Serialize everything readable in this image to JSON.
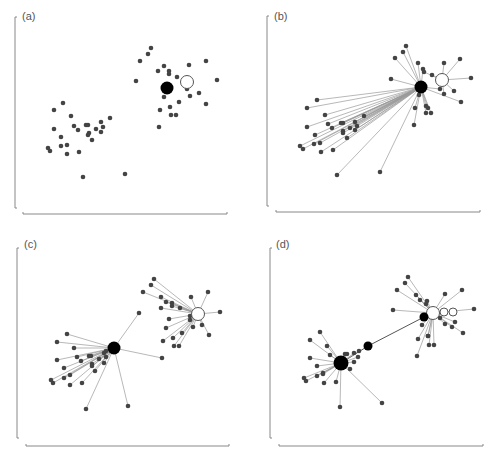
{
  "figure": {
    "colors": {
      "node": "#444444",
      "hub_black": "#000000",
      "hub_white_fill": "#ffffff",
      "hub_white_stroke": "#555555",
      "edge": "#9a9a9a",
      "axis": "#888888"
    },
    "panels": [
      {
        "label": "(a)",
        "offset": [
          0,
          0
        ],
        "label_pos": [
          22,
          22
        ],
        "axis": {
          "v": [
            15,
            17,
            208
          ],
          "h": [
            214,
            23,
            227
          ]
        },
        "black_hubs": [
          {
            "x": 167,
            "y": 88,
            "r": 6.5
          }
        ],
        "white_hubs": [
          {
            "x": 187,
            "y": 82,
            "r": 6.5
          }
        ],
        "edges": [],
        "points": [
          [
            151,
            48
          ],
          [
            148,
            54
          ],
          [
            140,
            61
          ],
          [
            136,
            81
          ],
          [
            158,
            71
          ],
          [
            164,
            66
          ],
          [
            169,
            71
          ],
          [
            169,
            74
          ],
          [
            177,
            77
          ],
          [
            189,
            65
          ],
          [
            206,
            61
          ],
          [
            217,
            80
          ],
          [
            199,
            93
          ],
          [
            190,
            96
          ],
          [
            187,
            89
          ],
          [
            164,
            97
          ],
          [
            179,
            102
          ],
          [
            206,
            104
          ],
          [
            160,
            110
          ],
          [
            170,
            107
          ],
          [
            171,
            115
          ],
          [
            176,
            115
          ],
          [
            159,
            127
          ],
          [
            125,
            174
          ],
          [
            63,
            103
          ],
          [
            54,
            110
          ],
          [
            71,
            116
          ],
          [
            54,
            129
          ],
          [
            74,
            126
          ],
          [
            78,
            130
          ],
          [
            86,
            125
          ],
          [
            88,
            125
          ],
          [
            101,
            122
          ],
          [
            103,
            127
          ],
          [
            96,
            129
          ],
          [
            110,
            118
          ],
          [
            89,
            133
          ],
          [
            88,
            135
          ],
          [
            101,
            132
          ],
          [
            61,
            137
          ],
          [
            92,
            140
          ],
          [
            48,
            148
          ],
          [
            50,
            151
          ],
          [
            61,
            146
          ],
          [
            67,
            145
          ],
          [
            67,
            154
          ],
          [
            79,
            152
          ],
          [
            83,
            177
          ]
        ]
      },
      {
        "label": "(b)",
        "offset": [
          246,
          0
        ],
        "label_pos": [
          28,
          22
        ],
        "axis": {
          "v": [
            21,
            16,
            206
          ],
          "h": [
            212,
            30,
            234
          ]
        },
        "black_hubs": [
          {
            "x": 175,
            "y": 87,
            "r": 6.5
          }
        ],
        "white_hubs": [
          {
            "x": 196,
            "y": 80,
            "r": 6.5
          }
        ],
        "hub_edges_from": [
          175,
          87
        ],
        "white_edges_from": [
          196,
          80
        ],
        "points": [
          [
            160,
            46
          ],
          [
            157,
            52
          ],
          [
            149,
            58
          ],
          [
            145,
            79
          ],
          [
            172,
            63
          ],
          [
            177,
            69
          ],
          [
            178,
            72
          ],
          [
            186,
            75
          ],
          [
            198,
            63
          ],
          [
            214,
            59
          ],
          [
            225,
            78
          ],
          [
            208,
            91
          ],
          [
            198,
            94
          ],
          [
            194,
            89
          ],
          [
            173,
            95
          ],
          [
            182,
            108
          ],
          [
            215,
            102
          ],
          [
            169,
            108
          ],
          [
            180,
            106
          ],
          [
            180,
            113
          ],
          [
            185,
            113
          ],
          [
            168,
            125
          ],
          [
            134,
            172
          ],
          [
            71,
            100
          ],
          [
            61,
            108
          ],
          [
            79,
            115
          ],
          [
            61,
            127
          ],
          [
            82,
            124
          ],
          [
            86,
            128
          ],
          [
            95,
            123
          ],
          [
            97,
            123
          ],
          [
            109,
            122
          ],
          [
            111,
            126
          ],
          [
            104,
            128
          ],
          [
            118,
            116
          ],
          [
            97,
            131
          ],
          [
            97,
            133
          ],
          [
            109,
            130
          ],
          [
            69,
            135
          ],
          [
            101,
            138
          ],
          [
            54,
            146
          ],
          [
            57,
            149
          ],
          [
            68,
            144
          ],
          [
            74,
            143
          ],
          [
            75,
            152
          ],
          [
            87,
            150
          ],
          [
            91,
            175
          ]
        ],
        "white_children": [
          6,
          7,
          8,
          9,
          10,
          11,
          12
        ]
      },
      {
        "label": "(c)",
        "offset": [
          0,
          228
        ],
        "label_pos": [
          24,
          22
        ],
        "axis": {
          "v": [
            17,
            20,
            210
          ],
          "h": [
            218,
            26,
            229
          ]
        },
        "black_hubs": [
          {
            "x": 114,
            "y": 120,
            "r": 6.5
          }
        ],
        "white_hubs": [
          {
            "x": 198,
            "y": 86,
            "r": 6.5
          }
        ],
        "points_black": [
          [
            139,
            85
          ],
          [
            162,
            130
          ],
          [
            67,
            106
          ],
          [
            57,
            114
          ],
          [
            74,
            120
          ],
          [
            57,
            132
          ],
          [
            77,
            129
          ],
          [
            81,
            133
          ],
          [
            89,
            128
          ],
          [
            91,
            128
          ],
          [
            104,
            125
          ],
          [
            106,
            129
          ],
          [
            99,
            131
          ],
          [
            106,
            123
          ],
          [
            92,
            136
          ],
          [
            92,
            138
          ],
          [
            104,
            135
          ],
          [
            64,
            140
          ],
          [
            95,
            143
          ],
          [
            51,
            152
          ],
          [
            53,
            155
          ],
          [
            64,
            150
          ],
          [
            70,
            147
          ],
          [
            70,
            157
          ],
          [
            82,
            155
          ],
          [
            86,
            181
          ],
          [
            128,
            178
          ]
        ],
        "points_white": [
          [
            154,
            51
          ],
          [
            151,
            57
          ],
          [
            143,
            64
          ],
          [
            161,
            69
          ],
          [
            166,
            74
          ],
          [
            172,
            75
          ],
          [
            172,
            78
          ],
          [
            180,
            80
          ],
          [
            191,
            69
          ],
          [
            208,
            64
          ],
          [
            220,
            84
          ],
          [
            202,
            97
          ],
          [
            193,
            99
          ],
          [
            190,
            92
          ],
          [
            169,
            91
          ],
          [
            182,
            105
          ],
          [
            209,
            107
          ],
          [
            166,
            100
          ],
          [
            173,
            110
          ],
          [
            174,
            118
          ],
          [
            179,
            118
          ],
          [
            163,
            113
          ],
          [
            190,
            88
          ],
          [
            161,
            80
          ]
        ]
      },
      {
        "label": "(d)",
        "offset": [
          246,
          228
        ],
        "label_pos": [
          30,
          22
        ],
        "axis": {
          "v": [
            24,
            20,
            210
          ],
          "h": [
            218,
            33,
            237
          ]
        },
        "black_hubs": [
          {
            "x": 95,
            "y": 135,
            "r": 7.5
          },
          {
            "x": 122,
            "y": 118,
            "r": 4.5
          },
          {
            "x": 178,
            "y": 89,
            "r": 4.5
          }
        ],
        "white_hubs": [
          {
            "x": 187,
            "y": 85,
            "r": 6.5
          },
          {
            "x": 198,
            "y": 84,
            "r": 4
          },
          {
            "x": 207,
            "y": 84,
            "r": 4
          }
        ],
        "chain": [
          [
            95,
            135
          ],
          [
            122,
            118
          ],
          [
            178,
            89
          ]
        ],
        "points_black": [
          [
            74,
            104
          ],
          [
            64,
            112
          ],
          [
            81,
            118
          ],
          [
            64,
            130
          ],
          [
            84,
            127
          ],
          [
            71,
            138
          ],
          [
            77,
            146
          ],
          [
            58,
            150
          ],
          [
            60,
            153
          ],
          [
            71,
            148
          ],
          [
            77,
            145
          ],
          [
            78,
            155
          ],
          [
            90,
            154
          ],
          [
            94,
            179
          ],
          [
            136,
            175
          ],
          [
            99,
            126
          ],
          [
            101,
            126
          ],
          [
            108,
            125
          ],
          [
            112,
            129
          ],
          [
            108,
            134
          ],
          [
            113,
            123
          ],
          [
            104,
            141
          ]
        ],
        "points_white": [
          [
            162,
            49
          ],
          [
            159,
            55
          ],
          [
            151,
            62
          ],
          [
            147,
            82
          ],
          [
            170,
            67
          ],
          [
            174,
            72
          ],
          [
            181,
            73
          ],
          [
            180,
            76
          ],
          [
            199,
            66
          ],
          [
            216,
            62
          ],
          [
            228,
            81
          ],
          [
            209,
            94
          ],
          [
            199,
            96
          ],
          [
            194,
            90
          ],
          [
            176,
            97
          ],
          [
            182,
            108
          ],
          [
            217,
            105
          ],
          [
            172,
            111
          ],
          [
            182,
            108
          ],
          [
            183,
            117
          ],
          [
            188,
            117
          ],
          [
            171,
            128
          ],
          [
            206,
            99
          ]
        ]
      }
    ]
  }
}
